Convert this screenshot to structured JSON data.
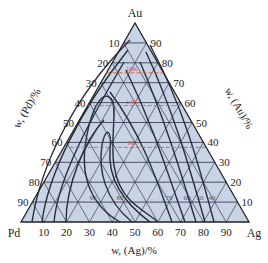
{
  "diagram": {
    "type": "ternary",
    "vertices": {
      "top": "Au",
      "left": "Pd",
      "right": "Ag"
    },
    "axes": {
      "bottom": {
        "title": "w, (Ag)/%",
        "ticks": [
          "10",
          "20",
          "30",
          "40",
          "50",
          "60",
          "70",
          "80",
          "90"
        ]
      },
      "left": {
        "title": "w, (Pd)/%",
        "ticks": [
          "10",
          "20",
          "30",
          "40",
          "50",
          "60",
          "70",
          "80",
          "90"
        ]
      },
      "right": {
        "title": "w, (Au)/%",
        "ticks": [
          "90",
          "80",
          "70",
          "60",
          "50",
          "40",
          "30",
          "20",
          "10"
        ]
      }
    },
    "karat_lines": [
      {
        "label": "18K",
        "au_fraction": 0.75
      },
      {
        "label": "14K",
        "au_fraction": 0.585
      },
      {
        "label": "9K",
        "au_fraction": 0.375
      }
    ],
    "isoline_labels": [
      "90",
      "80",
      "70",
      "60",
      "50",
      "40"
    ],
    "colors": {
      "fill": "#c9d3e6",
      "grid": "#3a3f55",
      "curve": "#2a2d3c",
      "karat": "#d0603a"
    }
  }
}
